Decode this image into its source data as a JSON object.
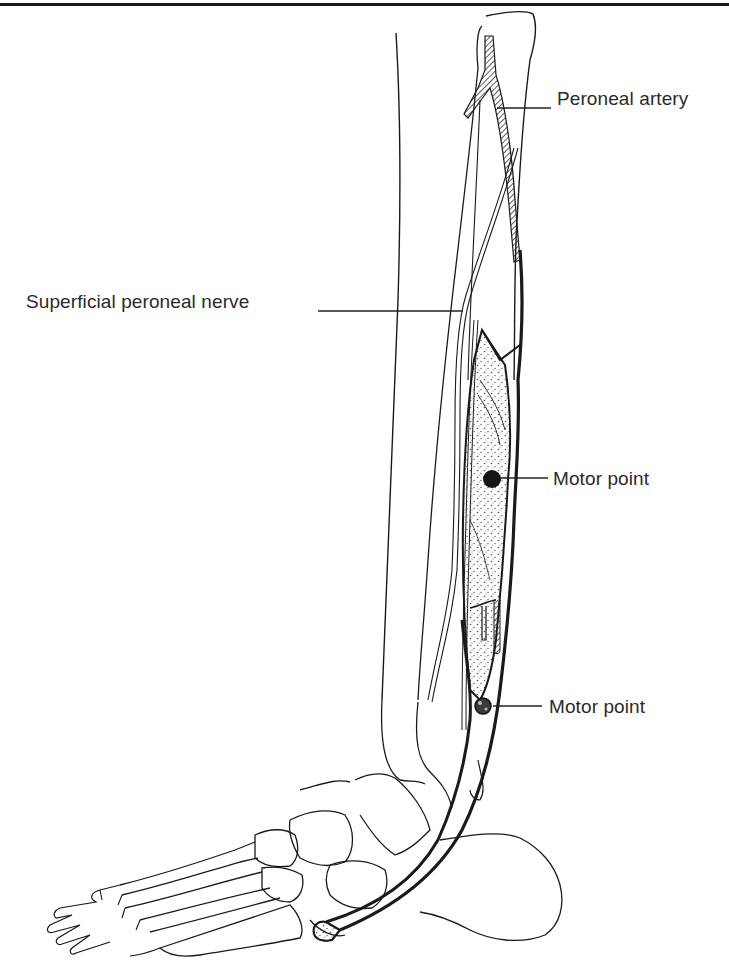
{
  "figure": {
    "labels": {
      "peroneal_artery": "Peroneal artery",
      "superficial_peroneal_nerve": "Superficial peroneal nerve",
      "motor_point_upper": "Motor point",
      "motor_point_lower": "Motor point"
    },
    "colors": {
      "ink": "#1a1a1a",
      "label_text": "#2a2a2a",
      "background": "#ffffff",
      "muscle_stipple": "#555555"
    }
  }
}
